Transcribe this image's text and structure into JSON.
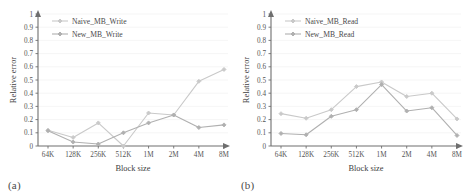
{
  "figure": {
    "panels": [
      {
        "id": "panel-a",
        "subplot_label": "(a)",
        "xlabel": "Block size",
        "ylabel": "Relative error"
      },
      {
        "id": "panel-b",
        "subplot_label": "(b)",
        "xlabel": "Block size",
        "ylabel": "Relative error"
      }
    ]
  },
  "axis": {
    "y_ticks": [
      "0",
      "0.1",
      "0.2",
      "0.3",
      "0.4",
      "0.5",
      "0.6",
      "0.7",
      "0.8",
      "0.9",
      "1"
    ],
    "x_ticks": [
      "64K",
      "128K",
      "256K",
      "512K",
      "1M",
      "2M",
      "4M",
      "8M"
    ]
  },
  "colors": {
    "naive_series": "#c9c9c9",
    "new_series": "#b0b0b0",
    "axis": "#6e6e6e",
    "grid": "#efefef",
    "text": "#555555"
  },
  "chart_data": [
    {
      "type": "line",
      "title": "(a)",
      "xlabel": "Block size",
      "ylabel": "Relative error",
      "ylim": [
        0,
        1
      ],
      "grid": true,
      "legend_position": "top-left",
      "categories": [
        "64K",
        "128K",
        "256K",
        "512K",
        "1M",
        "2M",
        "4M",
        "8M"
      ],
      "series": [
        {
          "name": "Naive_MB_Write",
          "color": "#c9c9c9",
          "marker": "diamond",
          "values": [
            0.12,
            0.065,
            0.175,
            0.0,
            0.25,
            0.235,
            0.49,
            0.58
          ]
        },
        {
          "name": "New_MB_Write",
          "color": "#b0b0b0",
          "marker": "diamond",
          "values": [
            0.115,
            0.03,
            0.015,
            0.1,
            0.175,
            0.235,
            0.14,
            0.16
          ]
        }
      ]
    },
    {
      "type": "line",
      "title": "(b)",
      "xlabel": "Block size",
      "ylabel": "Relative error",
      "ylim": [
        0,
        1
      ],
      "grid": true,
      "legend_position": "top-left",
      "categories": [
        "64K",
        "128K",
        "256K",
        "512K",
        "1M",
        "2M",
        "4M",
        "8M"
      ],
      "series": [
        {
          "name": "Naive_MB_Read",
          "color": "#c9c9c9",
          "marker": "diamond",
          "values": [
            0.245,
            0.21,
            0.275,
            0.45,
            0.485,
            0.375,
            0.4,
            0.205
          ]
        },
        {
          "name": "New_MB_Read",
          "color": "#b0b0b0",
          "marker": "diamond",
          "values": [
            0.095,
            0.085,
            0.225,
            0.275,
            0.465,
            0.265,
            0.29,
            0.08
          ]
        }
      ]
    }
  ]
}
